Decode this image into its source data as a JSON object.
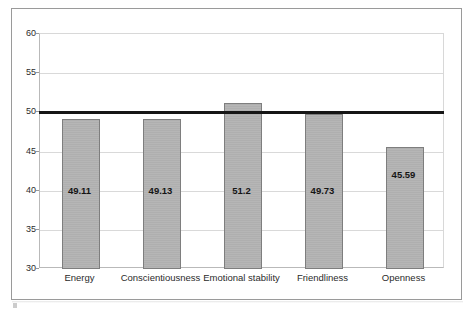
{
  "chart_data": {
    "type": "bar",
    "title": "",
    "subtitle": "",
    "xlabel": "",
    "ylabel": "",
    "categories": [
      "Energy",
      "Conscientiousness",
      "Emotional stability",
      "Friendliness",
      "Openness"
    ],
    "values": [
      49.11,
      49.13,
      51.2,
      49.73,
      45.59
    ],
    "value_labels": [
      "49.11",
      "49.13",
      "51.2",
      "49.73",
      "45.59"
    ],
    "ylim": [
      30,
      60
    ],
    "yticks": [
      30,
      35,
      40,
      45,
      50,
      55,
      60
    ],
    "ytick_labels": [
      "30",
      "35",
      "40",
      "45",
      "50",
      "55",
      "60"
    ],
    "grid": true,
    "legend": false,
    "legend_position": "none",
    "reference_line": {
      "value": 50,
      "color": "#161616",
      "width_px": 3
    },
    "bar_color": "#b2b2b2",
    "bar_border_color": "#7e7e7e",
    "gridline_color": "#d9d9d9",
    "axis_color": "#b9b9b9",
    "frame_color": "#9a9a9a",
    "text_color": "#2b2b2b"
  }
}
